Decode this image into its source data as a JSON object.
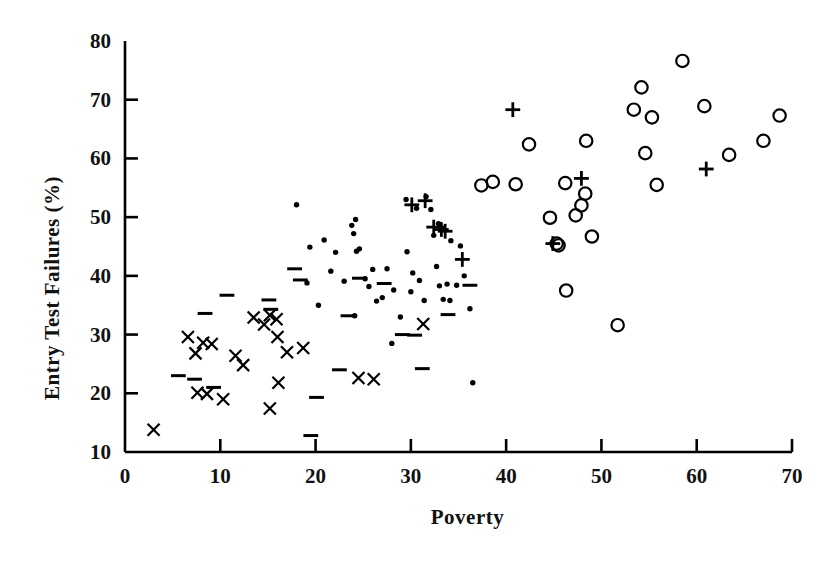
{
  "chart_data": {
    "type": "scatter",
    "title": "",
    "xlabel": "Poverty",
    "ylabel": "Entry Test Failures (%)",
    "xlim": [
      0,
      70
    ],
    "ylim": [
      10,
      80
    ],
    "xticks": [
      0,
      10,
      20,
      30,
      40,
      50,
      60,
      70
    ],
    "yticks": [
      10,
      20,
      30,
      40,
      50,
      60,
      70,
      80
    ],
    "grid": false,
    "legend": "none",
    "marker_color": "#000000",
    "series": [
      {
        "name": "cross",
        "marker": "x",
        "points": [
          [
            3.0,
            13.8
          ],
          [
            6.6,
            29.6
          ],
          [
            7.4,
            26.8
          ],
          [
            8.2,
            28.6
          ],
          [
            9.1,
            28.4
          ],
          [
            7.6,
            20.1
          ],
          [
            8.6,
            19.9
          ],
          [
            10.3,
            19.0
          ],
          [
            11.6,
            26.4
          ],
          [
            12.4,
            24.8
          ],
          [
            13.5,
            32.9
          ],
          [
            14.6,
            31.7
          ],
          [
            15.2,
            33.3
          ],
          [
            15.9,
            32.6
          ],
          [
            16.0,
            29.6
          ],
          [
            15.2,
            17.4
          ],
          [
            16.1,
            21.8
          ],
          [
            17.0,
            27.0
          ],
          [
            18.7,
            27.7
          ],
          [
            24.5,
            22.6
          ],
          [
            26.1,
            22.4
          ],
          [
            31.3,
            31.8
          ]
        ]
      },
      {
        "name": "dash",
        "marker": "-",
        "points": [
          [
            5.6,
            23.0
          ],
          [
            7.3,
            22.4
          ],
          [
            8.4,
            33.6
          ],
          [
            9.3,
            21.0
          ],
          [
            10.7,
            36.7
          ],
          [
            15.1,
            35.9
          ],
          [
            15.3,
            34.3
          ],
          [
            17.8,
            41.2
          ],
          [
            18.4,
            39.3
          ],
          [
            19.5,
            12.8
          ],
          [
            20.1,
            19.3
          ],
          [
            22.5,
            24.0
          ],
          [
            23.4,
            33.2
          ],
          [
            24.6,
            39.6
          ],
          [
            27.2,
            38.7
          ],
          [
            29.1,
            30.0
          ],
          [
            30.4,
            29.9
          ],
          [
            31.2,
            24.2
          ],
          [
            33.9,
            33.4
          ],
          [
            36.2,
            38.4
          ]
        ]
      },
      {
        "name": "dot",
        "marker": ".",
        "points": [
          [
            18.0,
            52.1
          ],
          [
            19.4,
            44.9
          ],
          [
            19.1,
            38.8
          ],
          [
            20.3,
            35.0
          ],
          [
            20.9,
            46.1
          ],
          [
            21.6,
            40.8
          ],
          [
            22.1,
            44.0
          ],
          [
            23.0,
            39.1
          ],
          [
            23.8,
            48.6
          ],
          [
            24.2,
            49.6
          ],
          [
            24.0,
            47.2
          ],
          [
            24.3,
            44.2
          ],
          [
            24.6,
            44.6
          ],
          [
            24.1,
            33.2
          ],
          [
            25.2,
            39.5
          ],
          [
            25.6,
            38.2
          ],
          [
            26.0,
            41.1
          ],
          [
            26.4,
            35.7
          ],
          [
            27.0,
            36.3
          ],
          [
            27.5,
            41.2
          ],
          [
            28.0,
            28.5
          ],
          [
            28.2,
            37.6
          ],
          [
            28.9,
            33.0
          ],
          [
            29.6,
            44.1
          ],
          [
            30.2,
            40.5
          ],
          [
            30.0,
            37.3
          ],
          [
            30.9,
            39.2
          ],
          [
            31.4,
            35.8
          ],
          [
            32.1,
            51.3
          ],
          [
            32.4,
            46.9
          ],
          [
            32.7,
            41.6
          ],
          [
            33.0,
            38.3
          ],
          [
            33.4,
            36.0
          ],
          [
            33.8,
            38.6
          ],
          [
            34.1,
            35.8
          ],
          [
            34.8,
            38.4
          ],
          [
            35.2,
            45.1
          ],
          [
            35.6,
            40.0
          ],
          [
            36.5,
            21.8
          ],
          [
            29.5,
            53.0
          ],
          [
            31.6,
            53.5
          ],
          [
            30.6,
            51.5
          ],
          [
            32.9,
            48.9
          ],
          [
            33.4,
            48.1
          ],
          [
            34.2,
            46.0
          ],
          [
            36.2,
            34.4
          ]
        ]
      },
      {
        "name": "plus",
        "marker": "+",
        "points": [
          [
            30.1,
            52.1
          ],
          [
            31.5,
            52.8
          ],
          [
            32.4,
            48.3
          ],
          [
            33.2,
            47.9
          ],
          [
            33.6,
            47.6
          ],
          [
            35.4,
            42.8
          ],
          [
            40.7,
            68.3
          ],
          [
            44.9,
            45.5
          ],
          [
            47.9,
            56.6
          ],
          [
            61.0,
            58.2
          ]
        ]
      },
      {
        "name": "circle",
        "marker": "o",
        "points": [
          [
            37.4,
            55.4
          ],
          [
            38.6,
            56.0
          ],
          [
            41.0,
            55.6
          ],
          [
            42.4,
            62.4
          ],
          [
            44.6,
            49.9
          ],
          [
            45.3,
            45.5
          ],
          [
            45.5,
            45.2
          ],
          [
            46.2,
            55.8
          ],
          [
            46.3,
            37.5
          ],
          [
            47.3,
            50.3
          ],
          [
            47.9,
            52.0
          ],
          [
            48.3,
            54.0
          ],
          [
            48.4,
            63.0
          ],
          [
            49.0,
            46.7
          ],
          [
            51.7,
            31.6
          ],
          [
            53.4,
            68.3
          ],
          [
            54.2,
            72.1
          ],
          [
            54.6,
            60.9
          ],
          [
            55.3,
            67.0
          ],
          [
            55.8,
            55.5
          ],
          [
            58.5,
            76.6
          ],
          [
            60.8,
            68.9
          ],
          [
            63.4,
            60.6
          ],
          [
            67.0,
            63.0
          ],
          [
            68.7,
            67.3
          ]
        ]
      }
    ]
  },
  "axes": {
    "x_axis_name": "poverty-axis",
    "y_axis_name": "entry-test-failures-axis"
  }
}
